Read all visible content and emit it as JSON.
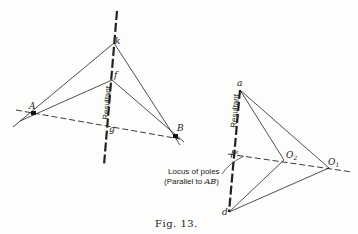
{
  "figure": {
    "caption": "Fig. 13.",
    "left": {
      "points": {
        "A": "A",
        "B": "B",
        "k": "k",
        "f": "f",
        "g": "g"
      },
      "resultant_label": "Resultant"
    },
    "right": {
      "points": {
        "a": "a",
        "d": "d",
        "e": "e",
        "O1": "O",
        "O1_sub": "1",
        "O2": "O",
        "O2_sub": "2"
      },
      "resultant_label": "Resultant",
      "locus_label_line1": "Locus of poles",
      "locus_label_line2": "(Parallel to ",
      "locus_label_ab": "AB",
      "locus_label_close": ")"
    }
  },
  "colors": {
    "ink": "#222222",
    "paper": "#fdfdfc"
  }
}
